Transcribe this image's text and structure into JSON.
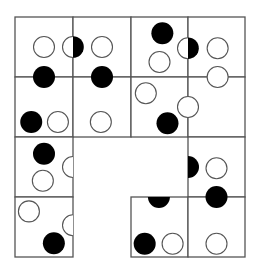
{
  "puzzle": {
    "title": "",
    "colors": {
      "black": "#000000",
      "white": "#ffffff",
      "line": "#555555"
    },
    "grid": {
      "rows": 4,
      "cols": 4
    },
    "cells_present": [
      [
        1,
        1,
        1,
        1
      ],
      [
        1,
        1,
        1,
        1
      ],
      [
        1,
        0,
        0,
        1
      ],
      [
        1,
        0,
        1,
        1
      ]
    ],
    "pieces": [
      {
        "type": "white",
        "cell": [
          0,
          0
        ],
        "pos": [
          0.5,
          0.5
        ]
      },
      {
        "type": "split-white-black",
        "cell": [
          0,
          0
        ],
        "pos": [
          1.0,
          0.5
        ]
      },
      {
        "type": "white",
        "cell": [
          0,
          1
        ],
        "pos": [
          0.5,
          0.5
        ]
      },
      {
        "type": "black",
        "cell": [
          0,
          0
        ],
        "pos": [
          0.5,
          1.0
        ]
      },
      {
        "type": "black",
        "cell": [
          0,
          1
        ],
        "pos": [
          0.5,
          1.0
        ]
      },
      {
        "type": "black",
        "cell": [
          0,
          2
        ],
        "pos": [
          0.55,
          0.27
        ]
      },
      {
        "type": "white",
        "cell": [
          0,
          2
        ],
        "pos": [
          0.5,
          0.75
        ]
      },
      {
        "type": "split-white-black",
        "cell": [
          0,
          2
        ],
        "pos": [
          1.0,
          0.52
        ]
      },
      {
        "type": "white",
        "cell": [
          0,
          3
        ],
        "pos": [
          0.52,
          0.52
        ]
      },
      {
        "type": "white",
        "cell": [
          0,
          3
        ],
        "pos": [
          0.52,
          1.0
        ]
      },
      {
        "type": "black",
        "cell": [
          1,
          0
        ],
        "pos": [
          0.28,
          0.75
        ]
      },
      {
        "type": "white",
        "cell": [
          1,
          0
        ],
        "pos": [
          0.74,
          0.75
        ]
      },
      {
        "type": "white",
        "cell": [
          1,
          1
        ],
        "pos": [
          0.48,
          0.75
        ]
      },
      {
        "type": "white",
        "cell": [
          1,
          2
        ],
        "pos": [
          0.26,
          0.27
        ]
      },
      {
        "type": "white",
        "cell": [
          1,
          2
        ],
        "pos": [
          1.0,
          0.5
        ]
      },
      {
        "type": "black",
        "cell": [
          1,
          2
        ],
        "pos": [
          0.64,
          0.77
        ]
      },
      {
        "type": "black",
        "cell": [
          2,
          0
        ],
        "pos": [
          0.5,
          0.28
        ]
      },
      {
        "type": "white",
        "cell": [
          2,
          0
        ],
        "pos": [
          0.48,
          0.73
        ]
      },
      {
        "type": "white-clip-right",
        "cell": [
          2,
          0
        ],
        "pos": [
          1.0,
          0.5
        ]
      },
      {
        "type": "black-clip-left",
        "cell": [
          2,
          3
        ],
        "pos": [
          0.0,
          0.5
        ]
      },
      {
        "type": "white",
        "cell": [
          2,
          3
        ],
        "pos": [
          0.5,
          0.52
        ]
      },
      {
        "type": "black",
        "cell": [
          2,
          3
        ],
        "pos": [
          0.5,
          1.0
        ]
      },
      {
        "type": "white",
        "cell": [
          3,
          0
        ],
        "pos": [
          0.24,
          0.24
        ]
      },
      {
        "type": "white-clip-right",
        "cell": [
          3,
          0
        ],
        "pos": [
          1.0,
          0.47
        ]
      },
      {
        "type": "black",
        "cell": [
          3,
          0
        ],
        "pos": [
          0.67,
          0.77
        ]
      },
      {
        "type": "black-clip-top",
        "cell": [
          3,
          2
        ],
        "pos": [
          0.49,
          0.0
        ]
      },
      {
        "type": "black",
        "cell": [
          3,
          2
        ],
        "pos": [
          0.24,
          0.78
        ]
      },
      {
        "type": "white",
        "cell": [
          3,
          2
        ],
        "pos": [
          0.73,
          0.78
        ]
      },
      {
        "type": "white",
        "cell": [
          3,
          3
        ],
        "pos": [
          0.5,
          0.78
        ]
      }
    ]
  }
}
